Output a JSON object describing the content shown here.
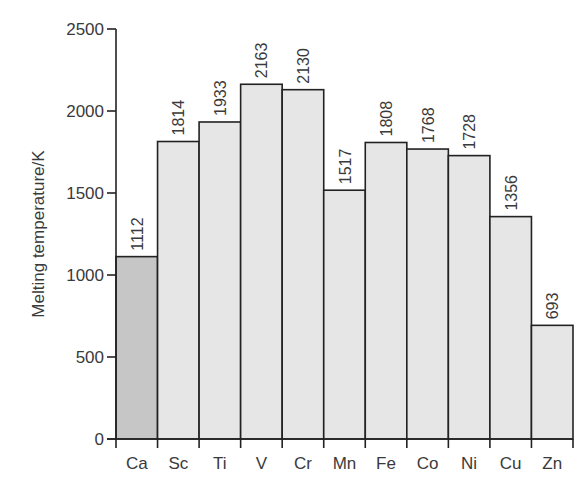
{
  "chart_data": {
    "type": "bar",
    "title": "",
    "xlabel": "",
    "ylabel": "Melting temperature/K",
    "ylim": [
      0,
      2500
    ],
    "yticks": [
      0,
      500,
      1000,
      1500,
      2000,
      2500
    ],
    "grid": false,
    "legend": null,
    "categories": [
      "Ca",
      "Sc",
      "Ti",
      "V",
      "Cr",
      "Mn",
      "Fe",
      "Co",
      "Ni",
      "Cu",
      "Zn"
    ],
    "values": [
      1112,
      1814,
      1933,
      2163,
      2130,
      1517,
      1808,
      1768,
      1728,
      1356,
      693
    ],
    "bar_colors": [
      "#c6c6c6",
      "#e6e6e6",
      "#e6e6e6",
      "#e6e6e6",
      "#e6e6e6",
      "#e6e6e6",
      "#e6e6e6",
      "#e6e6e6",
      "#e6e6e6",
      "#e6e6e6",
      "#e6e6e6"
    ],
    "highlighted_category": "Ca",
    "value_labels_rotated": true
  }
}
